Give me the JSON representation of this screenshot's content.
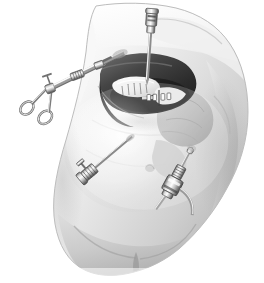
{
  "figure": {
    "modality": "grayscale medical line-and-wash illustration",
    "canvas": {
      "width": 264,
      "height": 283,
      "background": "#ffffff"
    },
    "palette": {
      "background": "#ffffff",
      "skin_highlight": "#fcfcfc",
      "skin_light": "#ededed",
      "skin_mid": "#d4d4d4",
      "skin_shadow": "#a8a8a8",
      "skin_deep_shadow": "#8a8a8a",
      "organ_dark": "#3a3a3a",
      "organ_darkest": "#202020",
      "organ_mid": "#6b6b6b",
      "metal_light": "#f2f2f2",
      "metal_mid": "#b5b5b5",
      "metal_dark": "#555555",
      "outline": "#7a7a7a",
      "clip_white": "#fafafa"
    }
  },
  "anatomy": {
    "torso": {
      "label": "patient torso, oblique anterior view",
      "region": "abdomen and lower chest"
    },
    "parts": [
      {
        "id": "chest",
        "label": "lower chest / breast contour"
      },
      {
        "id": "abdomen",
        "label": "insufflated abdominal wall"
      },
      {
        "id": "flank",
        "label": "right flank contour"
      },
      {
        "id": "pelvis",
        "label": "lower abdomen and pelvic brim"
      },
      {
        "id": "thigh",
        "label": "upper thigh"
      },
      {
        "id": "umbilicus",
        "label": "umbilicus"
      }
    ],
    "organs": [
      {
        "id": "liver",
        "label": "liver, right lobe retracted",
        "tone": "dark"
      },
      {
        "id": "gallbladder",
        "label": "gallbladder",
        "tone": "pale"
      },
      {
        "id": "cystic-duct",
        "label": "cystic duct with clips",
        "tone": "mid"
      },
      {
        "id": "stomach",
        "label": "stomach / bowel shadow",
        "tone": "mid"
      }
    ],
    "clips": {
      "label": "surgical clips on cystic duct and artery",
      "count": 4
    }
  },
  "instruments": [
    {
      "id": "grasper-left",
      "label": "Ring-handled laparoscopic grasping forceps",
      "entry": "left subcostal port",
      "position": "upper left",
      "handle_type": "scissor ring handles",
      "angle_deg": -20
    },
    {
      "id": "trocar-epigastric",
      "label": "Epigastric trocar port with valve cap",
      "entry": "epigastric port",
      "position": "top centre",
      "handle_type": "vertical cannula",
      "angle_deg": 4
    },
    {
      "id": "trocar-lower-left",
      "label": "Lateral trocar port with obturator handle",
      "entry": "left lateral port",
      "position": "lower left",
      "handle_type": "T-handle obturator",
      "angle_deg": 38
    },
    {
      "id": "trocar-umbilical",
      "label": "Umbilical trocar port with insufflation stopcock",
      "entry": "umbilical port",
      "position": "lower right",
      "handle_type": "valved cannula with gas line",
      "angle_deg": 28
    }
  ],
  "annotations": {
    "visible_text": [],
    "notes": "No text, labels, callouts, axis ticks or legend appear anywhere in the image."
  }
}
